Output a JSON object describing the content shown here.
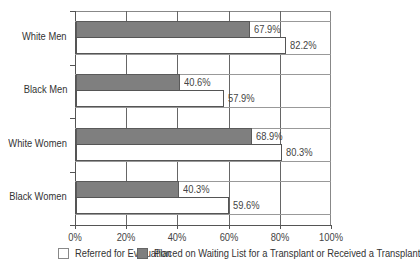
{
  "chart_data": {
    "type": "bar",
    "orientation": "horizontal",
    "title": "",
    "xlabel": "",
    "ylabel": "",
    "xlim": [
      0,
      100
    ],
    "grid": true,
    "legend_position": "bottom",
    "categories": [
      "White Men",
      "Black Men",
      "White Women",
      "Black Women"
    ],
    "series": [
      {
        "name": "Placed on Waiting List for a Transplant or Received a Transplant",
        "color": "#7f7f7f",
        "values": [
          67.9,
          40.6,
          68.9,
          40.3
        ]
      },
      {
        "name": "Referred for Evaluation",
        "color": "#ffffff",
        "values": [
          82.2,
          57.9,
          80.3,
          59.6
        ]
      }
    ],
    "x_ticks": [
      "0%",
      "20%",
      "40%",
      "60%",
      "80%",
      "100%"
    ]
  },
  "rows": [
    {
      "label": "White Men",
      "gray_value": 67.9,
      "gray_label": "67.9%",
      "white_value": 82.2,
      "white_label": "82.2%"
    },
    {
      "label": "Black Men",
      "gray_value": 40.6,
      "gray_label": "40.6%",
      "white_value": 57.9,
      "white_label": "57.9%"
    },
    {
      "label": "White Women",
      "gray_value": 68.9,
      "gray_label": "68.9%",
      "white_value": 80.3,
      "white_label": "80.3%"
    },
    {
      "label": "Black Women",
      "gray_value": 40.3,
      "gray_label": "40.3%",
      "white_value": 59.6,
      "white_label": "59.6%"
    }
  ],
  "x_ticks": [
    "0%",
    "20%",
    "40%",
    "60%",
    "80%",
    "100%"
  ],
  "legend": {
    "white_label": "Referred for Evaluation",
    "gray_label": "Placed on Waiting List for a Transplant or Received a Transplant"
  }
}
